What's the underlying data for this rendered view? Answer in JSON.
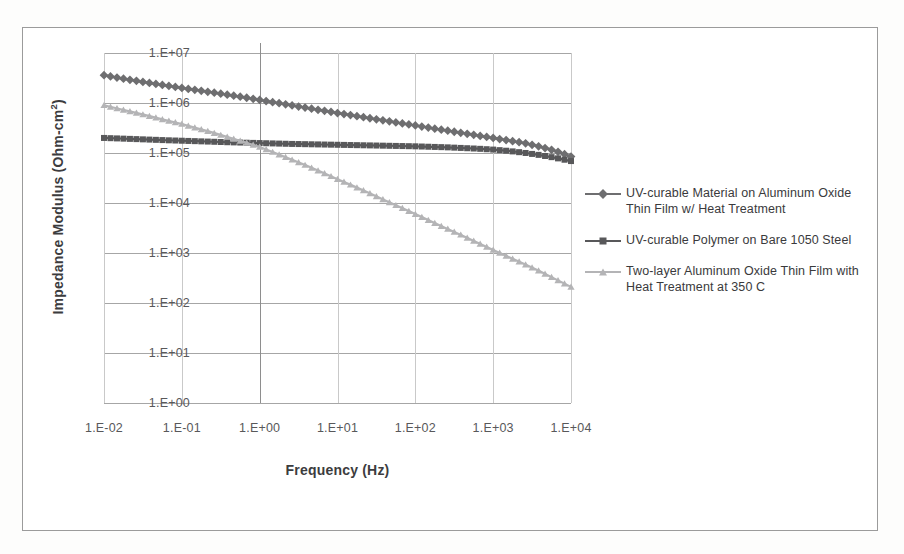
{
  "chart_data": {
    "type": "line",
    "title": "",
    "xlabel": "Frequency (Hz)",
    "ylabel": "Impedance Modulus (Ohm-cm2)",
    "ylabel_html": "Impedance Modulus (Ohm-cm&sup2;)",
    "x_scale": "log",
    "y_scale": "log",
    "xlim": [
      0.01,
      10000
    ],
    "ylim": [
      1,
      10000000
    ],
    "xtick_labels": [
      "1.E-02",
      "1.E-01",
      "1.E+00",
      "1.E+01",
      "1.E+02",
      "1.E+03",
      "1.E+04"
    ],
    "xtick_values": [
      0.01,
      0.1,
      1,
      10,
      100,
      1000,
      10000
    ],
    "ytick_labels": [
      "1.E+00",
      "1.E+01",
      "1.E+02",
      "1.E+03",
      "1.E+04",
      "1.E+05",
      "1.E+06",
      "1.E+07"
    ],
    "ytick_values": [
      1,
      10,
      100,
      1000,
      10000,
      100000,
      1000000,
      10000000
    ],
    "grid": "horizontal-and-vertical",
    "legend_position": "right",
    "series": [
      {
        "name": "UV-curable Material on Aluminum Oxide Thin Film w/ Heat Treatment",
        "marker": "diamond",
        "color": "#6e6e70",
        "x": [
          0.01,
          0.0158,
          0.0251,
          0.0398,
          0.0631,
          0.1,
          0.158,
          0.251,
          0.398,
          0.631,
          1,
          1.58,
          2.51,
          3.98,
          6.31,
          10,
          15.8,
          25.1,
          39.8,
          63.1,
          100,
          158,
          251,
          398,
          631,
          1000,
          1580,
          2510,
          3980,
          6310,
          10000
        ],
        "y": [
          3600000,
          3150000,
          2800000,
          2500000,
          2240000,
          2000000,
          1800000,
          1620000,
          1450000,
          1300000,
          1150000,
          1020000,
          905000,
          800000,
          710000,
          630000,
          562000,
          500000,
          447000,
          398000,
          355000,
          316000,
          282000,
          251000,
          224000,
          200000,
          178000,
          158000,
          134000,
          110000,
          85000
        ]
      },
      {
        "name": "UV-curable Polymer on Bare 1050 Steel",
        "marker": "square",
        "color": "#58585a",
        "x": [
          0.01,
          0.0158,
          0.0251,
          0.0398,
          0.0631,
          0.1,
          0.158,
          0.251,
          0.398,
          0.631,
          1,
          1.58,
          2.51,
          3.98,
          6.31,
          10,
          15.8,
          25.1,
          39.8,
          63.1,
          100,
          158,
          251,
          398,
          631,
          1000,
          1580,
          2510,
          3980,
          6310,
          10000
        ],
        "y": [
          200000,
          195000,
          190000,
          185000,
          180000,
          176000,
          172000,
          168000,
          164000,
          161000,
          158000,
          155000,
          152000,
          150000,
          148000,
          146000,
          144000,
          142000,
          140000,
          138000,
          136000,
          133000,
          130000,
          126000,
          122000,
          117000,
          110000,
          101000,
          91000,
          80000,
          69000
        ]
      },
      {
        "name": "Two-layer Aluminum Oxide Thin Film with Heat Treatment at 350 C",
        "marker": "triangle",
        "color": "#b4b4b6",
        "x": [
          0.01,
          0.0158,
          0.0251,
          0.0398,
          0.0631,
          0.1,
          0.158,
          0.251,
          0.398,
          0.631,
          1,
          1.58,
          2.51,
          3.98,
          6.31,
          10,
          15.8,
          25.1,
          39.8,
          63.1,
          100,
          158,
          251,
          398,
          631,
          1000,
          1580,
          2510,
          3980,
          6310,
          10000
        ],
        "y": [
          900000,
          760000,
          640000,
          540000,
          450000,
          380000,
          310000,
          255000,
          205000,
          165000,
          132000,
          100000,
          75000,
          56000,
          41000,
          30000,
          22000,
          16000,
          11500,
          8300,
          6000,
          4300,
          3100,
          2250,
          1600,
          1150,
          830,
          600,
          430,
          300,
          210
        ]
      }
    ]
  },
  "legend": {
    "entries": [
      {
        "label": "UV-curable Material on Aluminum Oxide Thin Film w/ Heat Treatment",
        "marker": "diamond",
        "color": "#6e6e70"
      },
      {
        "label": "UV-curable Polymer on Bare 1050 Steel",
        "marker": "square",
        "color": "#58585a"
      },
      {
        "label": "Two-layer Aluminum Oxide Thin Film with Heat Treatment at 350 C",
        "marker": "triangle",
        "color": "#b4b4b6"
      }
    ]
  }
}
